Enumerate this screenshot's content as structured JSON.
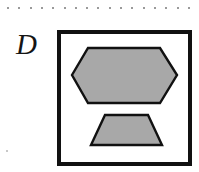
{
  "figure": {
    "panel_label": "D",
    "width": 199,
    "height": 172,
    "background_color": "#ffffff"
  },
  "perforation": {
    "name": "dotted-scan-edge",
    "dot_color": "#9a9a9a",
    "dot_count": 17,
    "dot_size_px": 2,
    "start_x": 7,
    "spacing_px": 11.3,
    "y": 7
  },
  "frame": {
    "name": "panel-border-box",
    "border_color": "#111111",
    "border_width_px": 4,
    "fill_color": "#ffffff",
    "x": 57,
    "y": 30,
    "width": 135,
    "height": 136
  },
  "shapes": [
    {
      "id": "hexagon",
      "name": "gray-hexagon",
      "type": "hexagon",
      "fill_color": "#a8a8a8",
      "stroke_color": "#111111",
      "stroke_width_px": 2.4,
      "points": "15,45 31,18 103,18 120,45 103,73 31,73",
      "description": "elongated horizontal hexagon"
    },
    {
      "id": "trapezoid",
      "name": "gray-trapezoid",
      "type": "trapezoid",
      "fill_color": "#a8a8a8",
      "stroke_color": "#111111",
      "stroke_width_px": 2.4,
      "points": "48,85 91,85 105,115 34,115",
      "description": "trapezoid narrow at top wide at bottom"
    }
  ],
  "speck": {
    "name": "scan-artifact-dot",
    "color": "#c8c8c8"
  }
}
